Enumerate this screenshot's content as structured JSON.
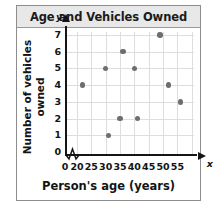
{
  "chart_data": {
    "type": "scatter",
    "title": "Age and Vehicles Owned",
    "xlabel": "Person's age (years)",
    "ylabel": "Number of vehicles owned",
    "x_var_letter": "x",
    "y_var_letter": "y",
    "xlim": [
      20,
      58
    ],
    "ylim": [
      0,
      7
    ],
    "x_ticks": [
      "0",
      "20",
      "25",
      "30",
      "35",
      "40",
      "45",
      "50",
      "55"
    ],
    "x_tick_values": [
      0,
      20,
      25,
      30,
      35,
      40,
      45,
      50,
      55
    ],
    "y_ticks": [
      "0",
      "1",
      "2",
      "3",
      "4",
      "5",
      "6",
      "7"
    ],
    "y_tick_values": [
      0,
      1,
      2,
      3,
      4,
      5,
      6,
      7
    ],
    "grid": true,
    "legend": "none",
    "axis_break_x": true,
    "point_color": "#6e6e6e",
    "grid_color": "#dedede",
    "axis_color": "#151515",
    "title_background": "#e8e8e8",
    "points": [
      {
        "x": 22,
        "y": 4
      },
      {
        "x": 30,
        "y": 5
      },
      {
        "x": 31,
        "y": 1
      },
      {
        "x": 35,
        "y": 2
      },
      {
        "x": 36,
        "y": 6
      },
      {
        "x": 40,
        "y": 5
      },
      {
        "x": 41,
        "y": 2
      },
      {
        "x": 49,
        "y": 7
      },
      {
        "x": 52,
        "y": 4
      },
      {
        "x": 56,
        "y": 3
      }
    ]
  }
}
